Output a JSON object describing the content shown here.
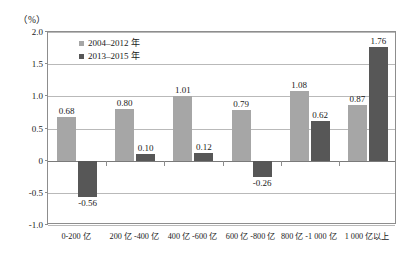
{
  "chart_data": {
    "type": "bar",
    "title": "",
    "subtitle": "",
    "xlabel": "",
    "ylabel": "（%）",
    "ylim": [
      -1.0,
      2.0
    ],
    "yticks": [
      "2.0",
      "1.5",
      "1.0",
      "0.5",
      "0",
      "-0.5",
      "-1.0"
    ],
    "ytick_values": [
      2.0,
      1.5,
      1.0,
      0.5,
      0,
      -0.5,
      -1.0
    ],
    "grid": true,
    "legend_position": "top-left-inside",
    "categories": [
      "0-200 亿",
      "200 亿 -400 亿",
      "400 亿 -600 亿",
      "600 亿 -800 亿",
      "800 亿 -1 000 亿",
      "1 000 亿以上"
    ],
    "series": [
      {
        "name": "2004–2012 年",
        "color": "#a6a6a6",
        "values": [
          0.68,
          0.8,
          1.01,
          0.79,
          1.08,
          0.87
        ],
        "labels": [
          "0.68",
          "0.80",
          "1.01",
          "0.79",
          "1.08",
          "0.87"
        ]
      },
      {
        "name": "2013–2015 年",
        "color": "#575757",
        "values": [
          -0.56,
          0.1,
          0.12,
          -0.26,
          0.62,
          1.76
        ],
        "labels": [
          "-0.56",
          "0.10",
          "0.12",
          "-0.26",
          "0.62",
          "1.76"
        ]
      }
    ]
  }
}
